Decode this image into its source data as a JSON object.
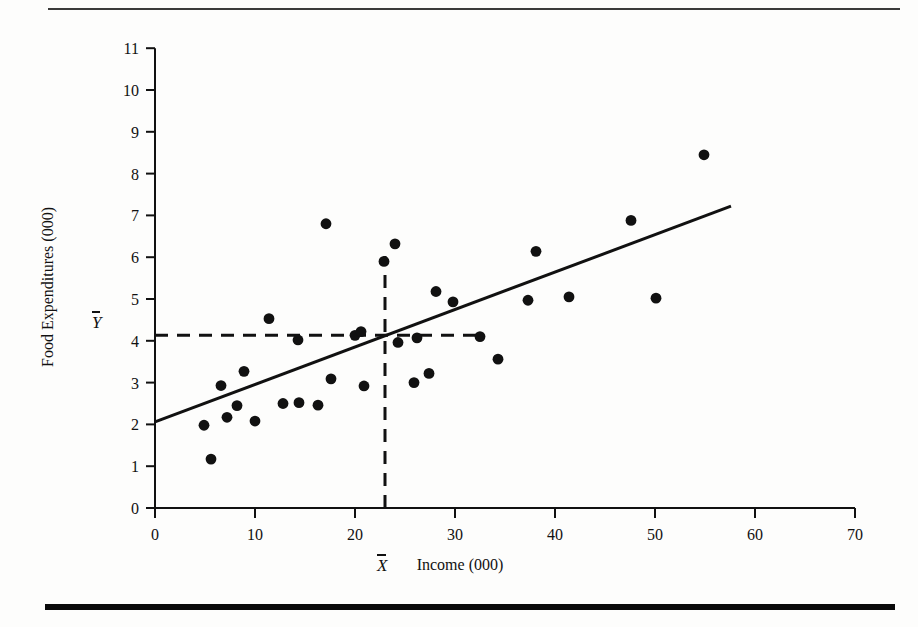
{
  "figure": {
    "top_rule": "horizontal-rule",
    "bottom_rule": "horizontal-rule-thick"
  },
  "chart_data": {
    "type": "scatter",
    "title": "",
    "xlabel": "Income (000)",
    "ylabel": "Food Expenditures (000)",
    "xlim": [
      0,
      70
    ],
    "ylim": [
      0,
      11
    ],
    "xticks": [
      0,
      10,
      20,
      30,
      40,
      50,
      60,
      70
    ],
    "yticks": [
      0,
      1,
      2,
      3,
      4,
      5,
      6,
      7,
      8,
      9,
      10,
      11
    ],
    "grid": false,
    "legend": null,
    "point_color": "#111111",
    "line_color": "#111111",
    "points": [
      {
        "x": 4.9,
        "y": 1.98
      },
      {
        "x": 5.6,
        "y": 1.17
      },
      {
        "x": 6.6,
        "y": 2.93
      },
      {
        "x": 7.2,
        "y": 2.17
      },
      {
        "x": 8.2,
        "y": 2.45
      },
      {
        "x": 8.9,
        "y": 3.27
      },
      {
        "x": 10.0,
        "y": 2.08
      },
      {
        "x": 11.4,
        "y": 4.53
      },
      {
        "x": 12.8,
        "y": 2.5
      },
      {
        "x": 14.3,
        "y": 4.02
      },
      {
        "x": 14.4,
        "y": 2.52
      },
      {
        "x": 16.3,
        "y": 2.46
      },
      {
        "x": 17.1,
        "y": 6.8
      },
      {
        "x": 17.6,
        "y": 3.09
      },
      {
        "x": 20.0,
        "y": 4.13
      },
      {
        "x": 20.6,
        "y": 4.22
      },
      {
        "x": 20.9,
        "y": 2.92
      },
      {
        "x": 22.9,
        "y": 5.9
      },
      {
        "x": 24.0,
        "y": 6.32
      },
      {
        "x": 24.3,
        "y": 3.96
      },
      {
        "x": 25.9,
        "y": 3.0
      },
      {
        "x": 26.2,
        "y": 4.07
      },
      {
        "x": 27.4,
        "y": 3.22
      },
      {
        "x": 28.1,
        "y": 5.18
      },
      {
        "x": 29.8,
        "y": 4.93
      },
      {
        "x": 32.5,
        "y": 4.1
      },
      {
        "x": 34.3,
        "y": 3.56
      },
      {
        "x": 37.3,
        "y": 4.97
      },
      {
        "x": 38.1,
        "y": 6.14
      },
      {
        "x": 41.4,
        "y": 5.05
      },
      {
        "x": 47.6,
        "y": 6.88
      },
      {
        "x": 50.1,
        "y": 5.02
      },
      {
        "x": 54.9,
        "y": 8.45
      }
    ],
    "regression_line": {
      "x_start": 0.0,
      "y_start": 2.06,
      "x_end": 57.6,
      "y_end": 7.22
    },
    "means": {
      "x_mean": 23.0,
      "y_mean": 4.13,
      "x_mean_label": "X",
      "y_mean_label": "Y",
      "vertical_dash_top": 6.03,
      "horizontal_dash_right": 33.0
    }
  }
}
